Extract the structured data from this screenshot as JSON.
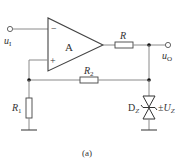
{
  "diagram": {
    "type": "circuit-schematic",
    "caption": "(a)",
    "colors": {
      "wire": "#8a8a8a",
      "component": "#444444",
      "text": "#333333",
      "node": "#111111"
    },
    "opamp": {
      "label": "A",
      "inverting_sign": "−",
      "noninverting_sign": "+"
    },
    "input": {
      "label": "u",
      "subscript": "I"
    },
    "output": {
      "label": "u",
      "subscript": "O"
    },
    "resistors": [
      {
        "id": "R",
        "label": "R",
        "subscript": ""
      },
      {
        "id": "R2",
        "label": "R",
        "subscript": "2"
      },
      {
        "id": "R1",
        "label": "R",
        "subscript": "1"
      }
    ],
    "zener": {
      "label": "D",
      "subscript": "Z",
      "voltage_prefix": "±",
      "voltage_label": "U",
      "voltage_subscript": "Z"
    }
  }
}
